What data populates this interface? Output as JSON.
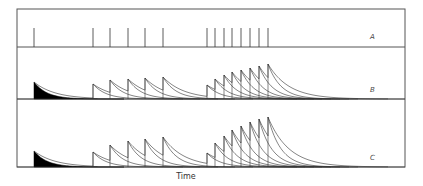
{
  "figure": {
    "x_axis_label": "Time",
    "panels": [
      {
        "id": "A",
        "label": "A",
        "kind": "spike-train"
      },
      {
        "id": "B",
        "label": "B",
        "kind": "summating-responses"
      },
      {
        "id": "C",
        "label": "C",
        "kind": "facilitating-summating-responses"
      }
    ],
    "spike_times_px": [
      34,
      93,
      110,
      128,
      145,
      163,
      207,
      215,
      224,
      232,
      241,
      250,
      259,
      268
    ],
    "panel_B_peak_heights": [
      17,
      15,
      19,
      20,
      21,
      22,
      14,
      20,
      24,
      27,
      29,
      31,
      33,
      35
    ],
    "panel_C_peak_heights": [
      16,
      15,
      22,
      26,
      28,
      30,
      14,
      24,
      31,
      37,
      41,
      45,
      48,
      50
    ],
    "decay_constant_px": 13,
    "colors": {
      "line": "#333333",
      "frame": "#555555",
      "first_response_fill": "#000000"
    }
  }
}
